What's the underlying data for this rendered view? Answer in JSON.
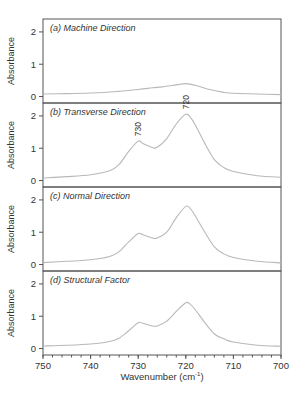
{
  "chart_data": [
    {
      "type": "line",
      "panel": "a",
      "title": "(a) Machine Direction",
      "xlabel": "Wavenumber (cm-1)",
      "ylabel": "Absorbance",
      "xlim": [
        750,
        700
      ],
      "ylim": [
        -0.2,
        2.4
      ],
      "yticks": [
        0,
        1,
        2
      ],
      "x": [
        750,
        745,
        740,
        735,
        730,
        727,
        725,
        722,
        720,
        718,
        715,
        712,
        710,
        705,
        700
      ],
      "values": [
        0.08,
        0.09,
        0.11,
        0.15,
        0.22,
        0.27,
        0.3,
        0.36,
        0.4,
        0.35,
        0.22,
        0.13,
        0.1,
        0.08,
        0.06
      ],
      "annotations": []
    },
    {
      "type": "line",
      "panel": "b",
      "title": "(b) Transverse Direction",
      "xlabel": "Wavenumber (cm-1)",
      "ylabel": "Absorbance",
      "xlim": [
        750,
        700
      ],
      "ylim": [
        -0.2,
        2.4
      ],
      "yticks": [
        0,
        1,
        2
      ],
      "x": [
        750,
        745,
        740,
        736,
        734,
        732,
        730,
        729,
        727,
        726,
        724,
        722,
        720,
        719,
        718,
        716,
        714,
        712,
        710,
        705,
        700
      ],
      "values": [
        0.08,
        0.12,
        0.18,
        0.3,
        0.5,
        0.9,
        1.22,
        1.15,
        1.02,
        1.03,
        1.3,
        1.75,
        2.05,
        1.95,
        1.72,
        1.15,
        0.65,
        0.4,
        0.28,
        0.15,
        0.1
      ],
      "annotations": [
        {
          "text": "730",
          "x": 730,
          "y": 1.22
        },
        {
          "text": "720",
          "x": 720,
          "y": 2.05
        }
      ]
    },
    {
      "type": "line",
      "panel": "c",
      "title": "(c) Normal Direction",
      "xlabel": "Wavenumber (cm-1)",
      "ylabel": "Absorbance",
      "xlim": [
        750,
        700
      ],
      "ylim": [
        -0.2,
        2.4
      ],
      "yticks": [
        0,
        1,
        2
      ],
      "x": [
        750,
        745,
        740,
        736,
        734,
        732,
        730,
        729,
        727,
        726,
        724,
        722,
        720,
        719,
        718,
        716,
        714,
        712,
        710,
        705,
        700
      ],
      "values": [
        0.06,
        0.1,
        0.15,
        0.25,
        0.4,
        0.7,
        0.96,
        0.92,
        0.82,
        0.82,
        1.0,
        1.45,
        1.8,
        1.72,
        1.5,
        1.0,
        0.55,
        0.33,
        0.22,
        0.1,
        0.05
      ],
      "annotations": []
    },
    {
      "type": "line",
      "panel": "d",
      "title": "(d) Structural Factor",
      "xlabel": "Wavenumber (cm-1)",
      "ylabel": "Absorbance",
      "xlim": [
        750,
        700
      ],
      "ylim": [
        -0.2,
        2.4
      ],
      "yticks": [
        0,
        1,
        2
      ],
      "x": [
        750,
        745,
        740,
        736,
        734,
        732,
        730,
        729,
        727,
        726,
        724,
        722,
        720,
        719,
        718,
        716,
        714,
        712,
        710,
        705,
        700
      ],
      "values": [
        0.08,
        0.1,
        0.14,
        0.22,
        0.32,
        0.55,
        0.8,
        0.78,
        0.7,
        0.7,
        0.85,
        1.15,
        1.42,
        1.36,
        1.2,
        0.8,
        0.45,
        0.3,
        0.2,
        0.1,
        0.07
      ],
      "annotations": []
    }
  ],
  "axes": {
    "xlabel_main": "Wavenumber (cm",
    "xlabel_sup": "-1",
    "xlabel_end": ")",
    "ylabel": "Absorbance",
    "xticks": [
      750,
      740,
      730,
      720,
      710,
      700
    ],
    "xticks_minor_step": 2
  },
  "colors": {
    "frame": "#555555",
    "curve": "#b8b8b8",
    "text": "#333333"
  }
}
